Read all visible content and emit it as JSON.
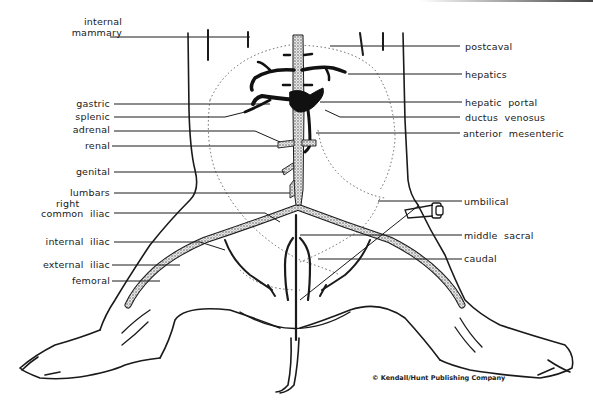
{
  "figure": {
    "copyright": "© Kendall/Hunt Publishing Company"
  },
  "labels": {
    "left": [
      {
        "id": "internal-mammary",
        "text": [
          "internal",
          "mammary"
        ]
      },
      {
        "id": "gastric",
        "text": [
          "gastric"
        ]
      },
      {
        "id": "splenic",
        "text": [
          "splenic"
        ]
      },
      {
        "id": "adrenal",
        "text": [
          "adrenal"
        ]
      },
      {
        "id": "renal",
        "text": [
          "renal"
        ]
      },
      {
        "id": "genital",
        "text": [
          "genital"
        ]
      },
      {
        "id": "lumbars",
        "text": [
          "lumbars"
        ]
      },
      {
        "id": "right-common-iliac",
        "text": [
          "right",
          "common  iliac"
        ]
      },
      {
        "id": "internal-iliac",
        "text": [
          "internal  iliac"
        ]
      },
      {
        "id": "external-iliac",
        "text": [
          "external  iliac"
        ]
      },
      {
        "id": "femoral",
        "text": [
          "femoral"
        ]
      }
    ],
    "right": [
      {
        "id": "postcaval",
        "text": [
          "postcaval"
        ]
      },
      {
        "id": "hepatics",
        "text": [
          "hepatics"
        ]
      },
      {
        "id": "hepatic-portal",
        "text": [
          "hepatic  portal"
        ]
      },
      {
        "id": "ductus-venosus",
        "text": [
          "ductus  venosus"
        ]
      },
      {
        "id": "anterior-mesenteric",
        "text": [
          "anterior  mesenteric"
        ]
      },
      {
        "id": "umbilical",
        "text": [
          "umbilical"
        ]
      },
      {
        "id": "middle-sacral",
        "text": [
          "middle  sacral"
        ]
      },
      {
        "id": "caudal",
        "text": [
          "caudal"
        ]
      }
    ]
  },
  "colors": {
    "ink": "#1a1a1a",
    "vessel_fill": "#bdbdbd",
    "background": "#ffffff"
  }
}
